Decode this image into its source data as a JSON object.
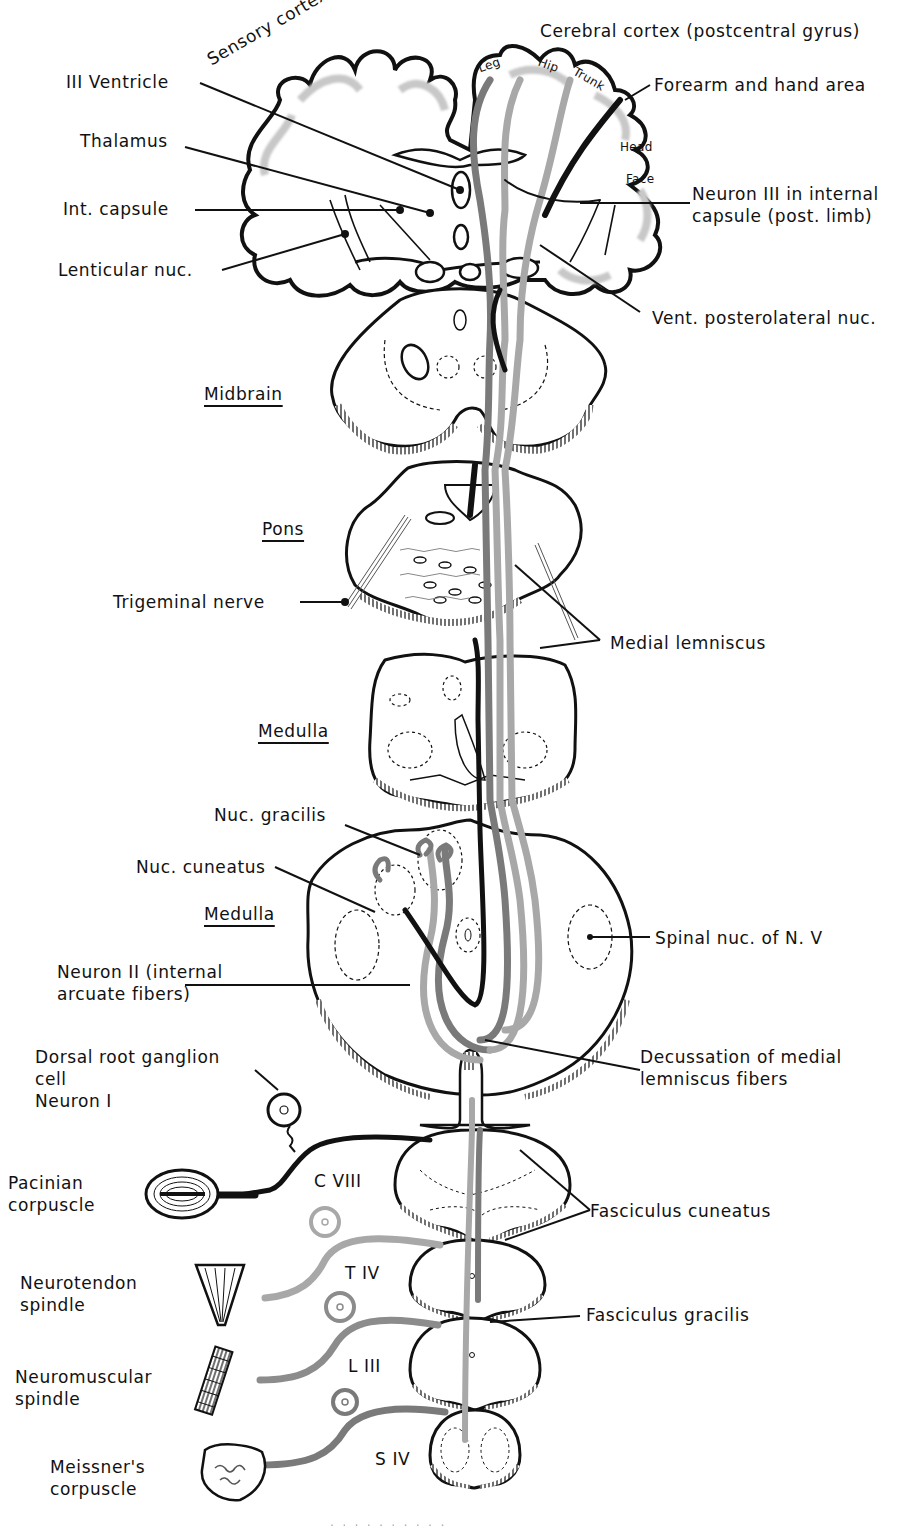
{
  "figure": {
    "colors": {
      "outline": "#111111",
      "pathway_black": "#111111",
      "pathway_mid_gray": "#7a7a7a",
      "pathway_light_gray": "#a8a8a8",
      "cortex_stipple": "#c8c8c8",
      "background": "#ffffff"
    }
  },
  "labels": {
    "sensory_cortex": "Sensory cortex",
    "cerebral_cortex": "Cerebral cortex (postcentral gyrus)",
    "third_ventricle": "III Ventricle",
    "thalamus": "Thalamus",
    "int_capsule": "Int. capsule",
    "lenticular_nuc": "Lenticular nuc.",
    "forearm_hand": "Forearm and hand area",
    "neuron_iii": "Neuron III in internal\ncapsule (post. limb)",
    "vpl_nuc": "Vent. posterolateral nuc.",
    "midbrain": "Midbrain",
    "pons": "Pons",
    "trigeminal_nerve": "Trigeminal nerve",
    "medial_lemniscus": "Medial lemniscus",
    "medulla_upper": "Medulla",
    "nuc_gracilis": "Nuc. gracilis",
    "nuc_cuneatus": "Nuc. cuneatus",
    "medulla_lower": "Medulla",
    "spinal_nuc_v": "Spinal nuc. of N. V",
    "neuron_ii": "Neuron II (internal\narcuate fibers)",
    "decussation": "Decussation of medial\nlemniscus fibers",
    "drg_cell": "Dorsal root ganglion\ncell\nNeuron I",
    "pacinian": "Pacinian\ncorpuscle",
    "neurotendon": "Neurotendon\nspindle",
    "neuromuscular": "Neuromuscular\nspindle",
    "meissner": "Meissner's\ncorpuscle",
    "fasc_cuneatus": "Fasciculus cuneatus",
    "fasc_gracilis": "Fasciculus gracilis"
  },
  "cortex_areas": {
    "leg": "Leg",
    "hip": "Hip",
    "trunk": "Trunk",
    "head": "Head",
    "face": "Face"
  },
  "spinal_levels": [
    {
      "id": "c8",
      "label": "C VIII"
    },
    {
      "id": "t4",
      "label": "T IV"
    },
    {
      "id": "l3",
      "label": "L III"
    },
    {
      "id": "s4",
      "label": "S IV"
    }
  ],
  "caption_fragment": "· · ·  ·  ·   ·  ·  ·   ·   ·"
}
